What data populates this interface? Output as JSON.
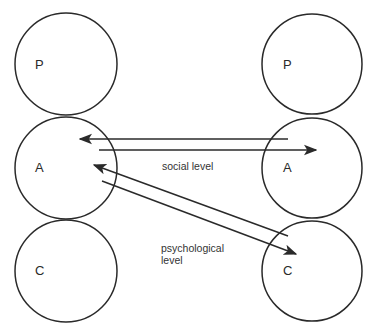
{
  "diagram": {
    "type": "transactional-analysis",
    "left_person": {
      "states": [
        {
          "id": "P",
          "label": "P"
        },
        {
          "id": "A",
          "label": "A"
        },
        {
          "id": "C",
          "label": "C"
        }
      ]
    },
    "right_person": {
      "states": [
        {
          "id": "P",
          "label": "P"
        },
        {
          "id": "A",
          "label": "A"
        },
        {
          "id": "C",
          "label": "C"
        }
      ]
    },
    "transactions": [
      {
        "from": "right.A",
        "to": "left.A",
        "level": "social"
      },
      {
        "from": "left.A",
        "to": "right.A",
        "level": "social"
      },
      {
        "from": "right.C",
        "to": "left.A",
        "level": "psychological"
      },
      {
        "from": "left.A",
        "to": "right.C",
        "level": "psychological"
      }
    ],
    "labels": {
      "social": "social level",
      "psychological_line1": "psychological",
      "psychological_line2": "level"
    }
  }
}
